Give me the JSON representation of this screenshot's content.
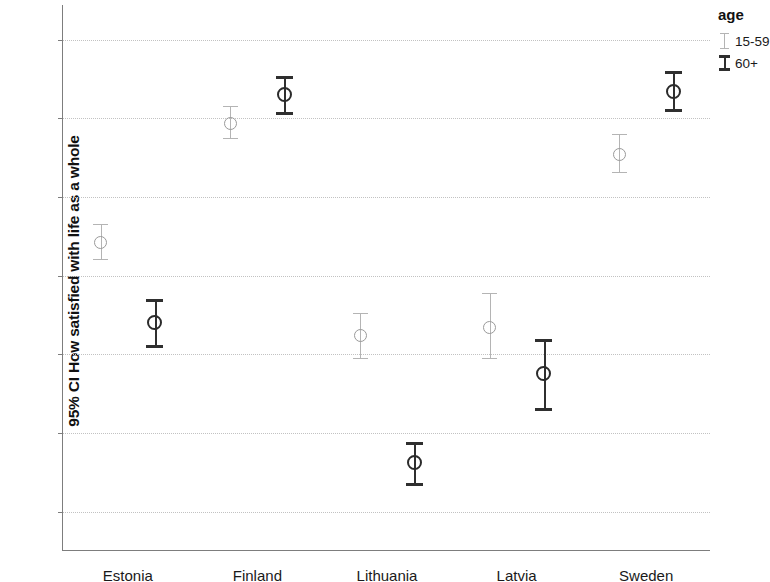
{
  "chart_data": {
    "type": "scatter",
    "title": "",
    "subtitle": "",
    "xlabel": "",
    "ylabel": "95% CI How satisfied with life as a whole",
    "ylim": [
      5.25,
      8.72
    ],
    "yticks": [
      5.5,
      6.0,
      6.5,
      7.0,
      7.5,
      8.0,
      8.5
    ],
    "ytick_labels": [
      "5,5",
      "6,0",
      "6,5",
      "7,0",
      "7,5",
      "8,0",
      "8,5"
    ],
    "grid": true,
    "legend_position": "right",
    "legend_title": "age",
    "categories": [
      "Estonia",
      "Finland",
      "Lithuania",
      "Latvia",
      "Sweden"
    ],
    "error_type": "95% confidence interval",
    "series": [
      {
        "name": "15-59",
        "color": "#b4b4b4",
        "marker": "open-circle",
        "values": [
          7.21,
          7.97,
          6.62,
          6.67,
          7.77
        ],
        "ci_low": [
          7.1,
          7.87,
          6.47,
          6.47,
          7.65
        ],
        "ci_high": [
          7.33,
          8.08,
          6.76,
          6.89,
          7.9
        ]
      },
      {
        "name": "60+",
        "color": "#2f2f2f",
        "marker": "open-circle",
        "values": [
          6.7,
          8.15,
          5.81,
          6.38,
          8.17
        ],
        "ci_low": [
          6.54,
          8.02,
          5.66,
          6.14,
          8.04
        ],
        "ci_high": [
          6.85,
          8.27,
          5.94,
          6.6,
          8.3
        ]
      }
    ]
  },
  "legend": {
    "title": "age",
    "items": [
      {
        "label": "15-59",
        "color": "#b4b4b4"
      },
      {
        "label": "60+",
        "color": "#2f2f2f"
      }
    ]
  },
  "axes": {
    "y_title": "95% CI How satisfied with life as a whole",
    "y_tick_labels": [
      "8,5",
      "8,0",
      "7,5",
      "7,0",
      "6,5",
      "6,0",
      "5,5"
    ],
    "x_tick_labels": [
      "Estonia",
      "Finland",
      "Lithuania",
      "Latvia",
      "Sweden"
    ]
  }
}
